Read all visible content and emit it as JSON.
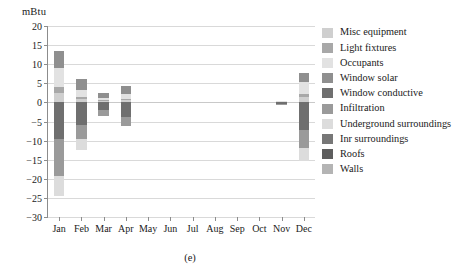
{
  "figure": {
    "caption": "(e)",
    "y_axis_unit": "mBtu"
  },
  "chart_data": {
    "type": "bar",
    "title": "",
    "xlabel": "",
    "ylabel": "mBtu",
    "ylim": [
      -30,
      20
    ],
    "ytick_step": 5,
    "yticks": [
      20,
      15,
      10,
      5,
      0,
      -5,
      -10,
      -15,
      -20,
      -25,
      -30
    ],
    "ytick_labels": [
      "20",
      "15",
      "10",
      "5",
      "0",
      "−5",
      "−10",
      "−15",
      "−20",
      "−25",
      "−30"
    ],
    "grid": true,
    "stacked": true,
    "legend_position": "right",
    "categories": [
      "Jan",
      "Feb",
      "Mar",
      "Apr",
      "May",
      "Jun",
      "Jul",
      "Aug",
      "Sep",
      "Oct",
      "Nov",
      "Dec"
    ],
    "series": [
      {
        "name": "Misc equipment",
        "color": "#cfcfcf",
        "values": [
          2.4,
          0.8,
          0.3,
          0.5,
          0,
          0,
          0,
          0,
          0,
          0,
          0.1,
          1.3
        ]
      },
      {
        "name": "Light fixtures",
        "color": "#a8a8a8",
        "values": [
          1.6,
          0.6,
          0.2,
          0.4,
          0,
          0,
          0,
          0,
          0,
          0,
          0.1,
          1.0
        ]
      },
      {
        "name": "Occupants",
        "color": "#e2e2e2",
        "values": [
          5.1,
          1.9,
          0.6,
          1.2,
          0,
          0,
          0,
          0,
          0,
          0,
          0.1,
          3.0
        ]
      },
      {
        "name": "Window solar",
        "color": "#8f8f8f",
        "values": [
          4.3,
          2.9,
          1.4,
          2.1,
          0,
          0,
          0,
          0,
          0,
          0,
          0.0,
          2.3
        ]
      },
      {
        "name": "Window conductive",
        "color": "#6f6f6f",
        "values": [
          -9.6,
          -6.0,
          -2.1,
          -3.9,
          0,
          0,
          0,
          0,
          0,
          0,
          -0.4,
          -7.2
        ]
      },
      {
        "name": "Infiltration",
        "color": "#9a9a9a",
        "values": [
          -9.6,
          -3.7,
          -1.4,
          -2.4,
          0,
          0,
          0,
          0,
          0,
          0,
          -0.4,
          -4.7
        ]
      },
      {
        "name": "Underground surroundings",
        "color": "#dcdcdc",
        "values": [
          -5.3,
          -2.8,
          0.0,
          0.0,
          0,
          0,
          0,
          0,
          0,
          0,
          0.0,
          -3.4
        ]
      },
      {
        "name": "Inr surroundings",
        "color": "#777777",
        "values": [
          0,
          0,
          0,
          0,
          0,
          0,
          0,
          0,
          0,
          0,
          0,
          0
        ]
      },
      {
        "name": "Roofs",
        "color": "#5e5e5e",
        "values": [
          0,
          0,
          0,
          0,
          0,
          0,
          0,
          0,
          0,
          0,
          0,
          0
        ]
      },
      {
        "name": "Walls",
        "color": "#b4b4b4",
        "values": [
          0,
          0,
          0,
          0,
          0,
          0,
          0,
          0,
          0,
          0,
          0,
          0
        ]
      }
    ],
    "totals_positive": [
      13.4,
      6.2,
      2.5,
      4.2,
      0,
      0,
      0,
      0,
      0,
      0,
      0.3,
      7.6
    ],
    "totals_negative": [
      -24.5,
      -12.5,
      -3.5,
      -6.3,
      0,
      0,
      0,
      0,
      0,
      0,
      -0.8,
      -15.3
    ]
  },
  "legend": {
    "items": [
      {
        "label": "Misc equipment",
        "color": "#cfcfcf"
      },
      {
        "label": "Light fixtures",
        "color": "#a8a8a8"
      },
      {
        "label": "Occupants",
        "color": "#e2e2e2"
      },
      {
        "label": "Window solar",
        "color": "#8f8f8f"
      },
      {
        "label": "Window conductive",
        "color": "#6f6f6f"
      },
      {
        "label": "Infiltration",
        "color": "#9a9a9a"
      },
      {
        "label": "Underground surroundings",
        "color": "#dcdcdc"
      },
      {
        "label": "Inr surroundings",
        "color": "#777777"
      },
      {
        "label": "Roofs",
        "color": "#5e5e5e"
      },
      {
        "label": "Walls",
        "color": "#b4b4b4"
      }
    ]
  }
}
